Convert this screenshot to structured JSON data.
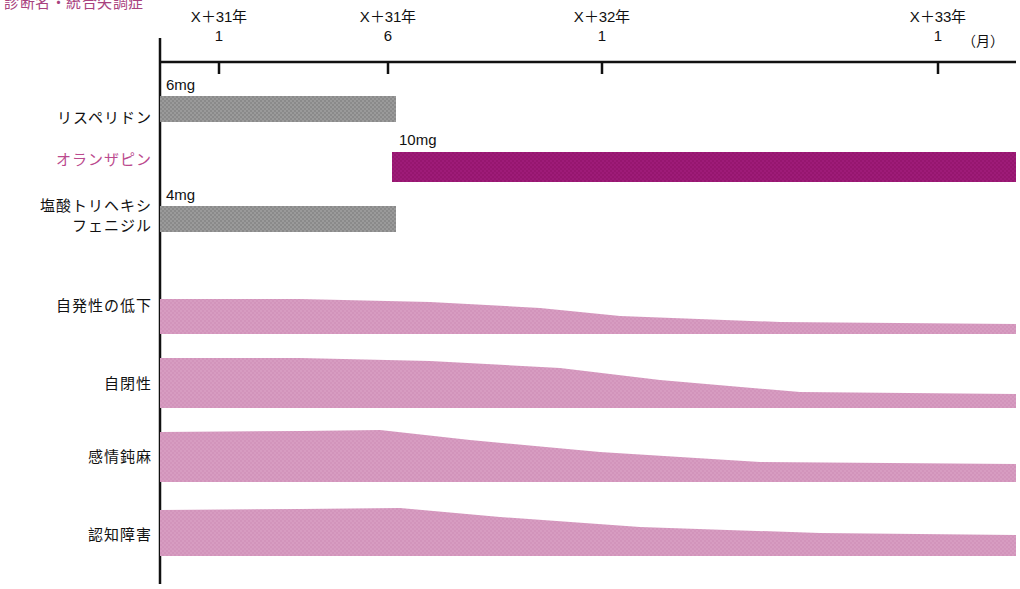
{
  "title": "診断名・統合失調症",
  "axis": {
    "unit_label": "（月）",
    "ticks": [
      {
        "year": "X＋31年",
        "month": "1",
        "x": 219
      },
      {
        "year": "X＋31年",
        "month": "6",
        "x": 388
      },
      {
        "year": "X＋32年",
        "month": "1",
        "x": 602
      },
      {
        "year": "X＋33年",
        "month": "1",
        "x": 938
      }
    ],
    "origin_x": 160,
    "line_y": 62,
    "end_x": 1016
  },
  "colors": {
    "gray_bar": "#9a9a9a",
    "magenta_bar": "#9e1b78",
    "pink_band": "#d79cc1",
    "accent_text": "#bb4a8e",
    "axis": "#111111"
  },
  "medications": [
    {
      "name": "リスペリドン",
      "dose": "6mg",
      "color_key": "gray_bar",
      "start_x": 160,
      "end_x": 396,
      "y": 96,
      "height": 26,
      "dose_x": 166,
      "dose_y": 76,
      "label_x": 20,
      "label_y": 118
    },
    {
      "name": "オランザピン",
      "dose": "10mg",
      "color_key": "magenta_bar",
      "start_x": 392,
      "end_x": 1016,
      "y": 152,
      "height": 30,
      "dose_x": 399,
      "dose_y": 131,
      "label_x": 20,
      "label_y": 160
    },
    {
      "name": "塩酸トリヘキシ\nフェニジル",
      "dose": "4mg",
      "color_key": "gray_bar",
      "start_x": 160,
      "end_x": 396,
      "y": 206,
      "height": 26,
      "dose_x": 166,
      "dose_y": 186,
      "label_x": 20,
      "label_y": 206
    }
  ],
  "symptoms": [
    {
      "name": "自発性の低下",
      "label_x": 30,
      "label_y": 307,
      "top_points": "160,299 300,299 430,302 540,308 620,316 780,322 1016,324",
      "bottom_points": "1016,334 780,334 620,334 540,334 430,334 300,334 160,334"
    },
    {
      "name": "自閉性",
      "label_x": 30,
      "label_y": 385,
      "top_points": "160,358 300,358 430,361 560,368 660,380 800,392 1016,394",
      "bottom_points": "1016,408 800,408 660,408 560,408 430,408 300,408 160,408"
    },
    {
      "name": "感情鈍麻",
      "label_x": 30,
      "label_y": 458,
      "top_points": "160,432 300,431 380,430 470,440 600,452 760,462 1016,464",
      "bottom_points": "1016,482 760,482 600,482 470,482 380,482 300,482 160,482"
    },
    {
      "name": "認知障害",
      "label_x": 30,
      "label_y": 536,
      "top_points": "160,510 300,509 400,508 500,517 640,527 820,533 1016,535",
      "bottom_points": "1016,556 820,556 640,556 500,556 400,556 300,556 160,556"
    }
  ]
}
